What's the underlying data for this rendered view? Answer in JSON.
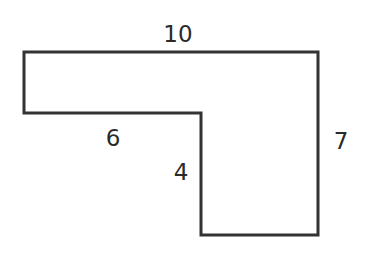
{
  "figure": {
    "type": "L-shaped polygon",
    "stroke_color": "#333333",
    "fill_color": "#ffffff",
    "stroke_width": 3,
    "vertices": [
      [
        24,
        52
      ],
      [
        318,
        52
      ],
      [
        318,
        235
      ],
      [
        201,
        235
      ],
      [
        201,
        113
      ],
      [
        24,
        113
      ]
    ]
  },
  "labels": {
    "top": {
      "text": "10",
      "x": 178,
      "y": 42
    },
    "inner_horizontal": {
      "text": "6",
      "x": 113,
      "y": 146
    },
    "inner_vertical": {
      "text": "4",
      "x": 181,
      "y": 180
    },
    "right": {
      "text": "7",
      "x": 341,
      "y": 149
    }
  }
}
